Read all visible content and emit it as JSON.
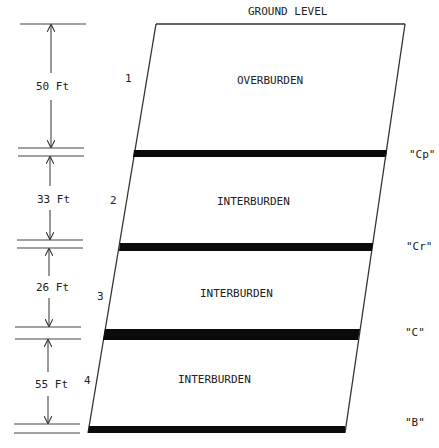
{
  "title": "GROUND LEVEL",
  "layers": [
    {
      "number": "1",
      "name": "OVERBURDEN",
      "thickness": "50 Ft"
    },
    {
      "number": "2",
      "name": "INTERBURDEN",
      "thickness": "33 Ft"
    },
    {
      "number": "3",
      "name": "INTERBURDEN",
      "thickness": "26 Ft"
    },
    {
      "number": "4",
      "name": "INTERBURDEN",
      "thickness": "55 Ft"
    }
  ],
  "seams": [
    {
      "label": "\"Cp\""
    },
    {
      "label": "\"Cr\""
    },
    {
      "label": "\"C\""
    },
    {
      "label": "\"B\""
    }
  ],
  "colors": {
    "seam": "#0a0a0a",
    "line": "#333333",
    "background": "#ffffff"
  }
}
